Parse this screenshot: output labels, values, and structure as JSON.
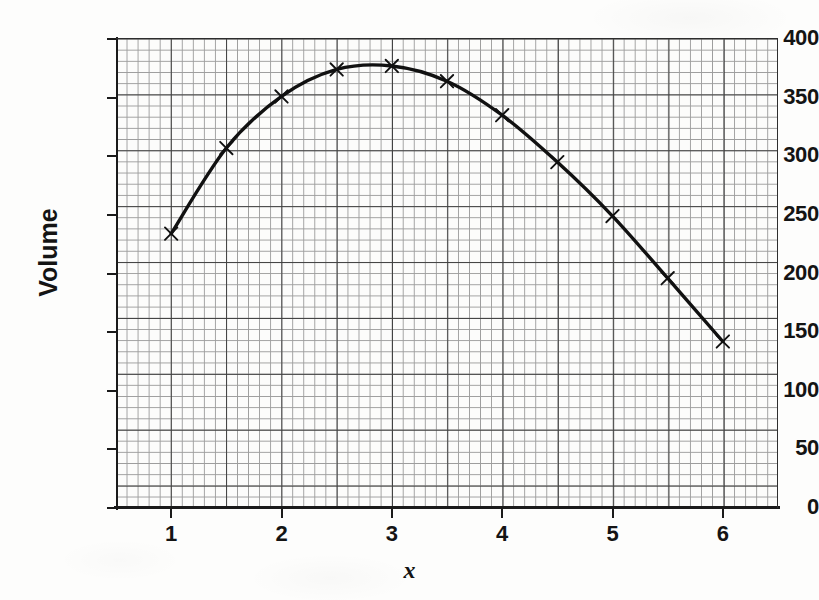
{
  "chart_data": {
    "type": "line",
    "title": "",
    "xlabel": "x",
    "ylabel": "Volume",
    "x": [
      1,
      1.5,
      2,
      2.5,
      3,
      3.5,
      4,
      4.5,
      5,
      5.5,
      6
    ],
    "values": [
      234,
      307,
      351,
      374,
      377,
      364,
      335,
      295,
      249,
      196,
      142
    ],
    "series": [
      {
        "name": "Volume",
        "marker": "x-cross",
        "values": [
          234,
          307,
          351,
          374,
          377,
          364,
          335,
          295,
          249,
          196,
          142
        ]
      }
    ],
    "xlim": [
      0.5,
      6.5
    ],
    "ylim": [
      0,
      400
    ],
    "xticks": [
      1,
      2,
      3,
      4,
      5,
      6
    ],
    "yticks": [
      0,
      50,
      100,
      150,
      200,
      250,
      300,
      350,
      400
    ],
    "xtick_labels": [
      "1",
      "2",
      "3",
      "4",
      "5",
      "6"
    ],
    "ytick_labels": [
      "0",
      "50",
      "100",
      "150",
      "200",
      "250",
      "300",
      "350",
      "400"
    ],
    "grid": true,
    "grid_minor": true,
    "legend": "none",
    "line_color": "#111111",
    "grid_color": "#8d8d8d",
    "grid_major_color": "#3a3a3a",
    "background": "#fcfcfb"
  }
}
